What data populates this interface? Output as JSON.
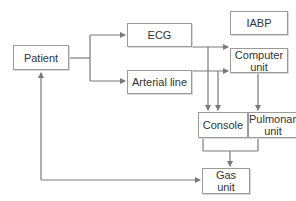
{
  "diagram": {
    "type": "flow",
    "colors": {
      "line": "#7a7a7a",
      "box_border": "#9a9a9a",
      "text": "#333333"
    },
    "nodes": {
      "patient": {
        "label": "Patient"
      },
      "ecg": {
        "label": "ECG"
      },
      "arterial_line": {
        "label": "Arterial line"
      },
      "iabp": {
        "label": "IABP"
      },
      "computer_unit": {
        "label": "Computer unit"
      },
      "console": {
        "label": "Console"
      },
      "pulmonary_unit": {
        "label": "Pulmonary unit"
      },
      "gas_unit": {
        "label": "Gas unit"
      }
    },
    "edges": [
      {
        "from": "Patient",
        "to": "ECG"
      },
      {
        "from": "Patient",
        "to": "Arterial line"
      },
      {
        "from": "ECG",
        "to": "Computer unit"
      },
      {
        "from": "ECG",
        "to": "Console"
      },
      {
        "from": "Arterial line",
        "to": "Computer unit"
      },
      {
        "from": "Arterial line",
        "to": "Console"
      },
      {
        "from": "Computer unit",
        "to": "Pulmonary unit"
      },
      {
        "from": "Console",
        "to": "Gas unit"
      },
      {
        "from": "Pulmonary unit",
        "to": "Gas unit"
      },
      {
        "from": "Gas unit",
        "to": "Patient"
      }
    ]
  }
}
